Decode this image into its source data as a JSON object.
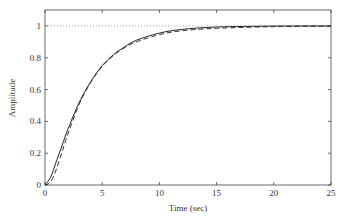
{
  "chart_data": {
    "type": "line",
    "title": "",
    "xlabel": "Time (sec)",
    "ylabel": "Amplitude",
    "xlim": [
      0,
      25
    ],
    "ylim": [
      0,
      1.1
    ],
    "grid": false,
    "legend": null,
    "xticks": [
      0,
      5,
      10,
      15,
      20,
      25
    ],
    "yticks": [
      0,
      0.2,
      0.4,
      0.6,
      0.8,
      1
    ],
    "xtick_labels": [
      "0",
      "5",
      "10",
      "15",
      "20",
      "25"
    ],
    "ytick_labels": [
      "0",
      "0.2",
      "0.4",
      "0.6",
      "0.8",
      "1"
    ],
    "reference_line": {
      "y": 1,
      "style": "dotted"
    },
    "series": [
      {
        "name": "response-solid",
        "style": "solid",
        "x": [
          0,
          0.5,
          1,
          1.5,
          2,
          3,
          4,
          5,
          6,
          7,
          8,
          10,
          12,
          15,
          20,
          25
        ],
        "y": [
          0,
          0.05,
          0.15,
          0.25,
          0.35,
          0.52,
          0.65,
          0.75,
          0.82,
          0.87,
          0.91,
          0.955,
          0.978,
          0.993,
          0.999,
          1.0
        ]
      },
      {
        "name": "response-dashed",
        "style": "dashed",
        "x": [
          0,
          0.5,
          1,
          1.5,
          2,
          3,
          4,
          5,
          6,
          7,
          8,
          10,
          12,
          15,
          20,
          25
        ],
        "y": [
          0,
          0.02,
          0.1,
          0.21,
          0.32,
          0.51,
          0.645,
          0.745,
          0.815,
          0.865,
          0.9,
          0.945,
          0.97,
          0.985,
          0.995,
          0.998
        ]
      }
    ]
  }
}
